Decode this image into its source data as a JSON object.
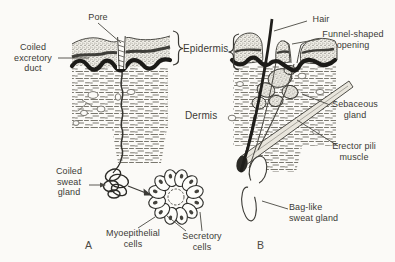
{
  "figure": {
    "background_color": "#fbfaf7",
    "ink_color": "#2b2a26",
    "labels": {
      "pore": "Pore",
      "coiled_excretory_duct": "Coiled\nexcretory\nduct",
      "epidermis": "Epidermis",
      "dermis": "Dermis",
      "hair": "Hair",
      "funnel_shaped_opening": "Funnel-shaped\nopening",
      "sebaceous_gland": "Sebaceous\ngland",
      "erector_pili_muscle": "Erector pili\nmuscle",
      "bag_like_sweat_gland": "Bag-like\nsweat gland",
      "coiled_sweat_gland": "Coiled\nsweat\ngland",
      "myoepithelial_cells": "Myoepithelial\ncells",
      "secretory_cells": "Secretory\ncells",
      "panel_a": "A",
      "panel_b": "B"
    }
  }
}
